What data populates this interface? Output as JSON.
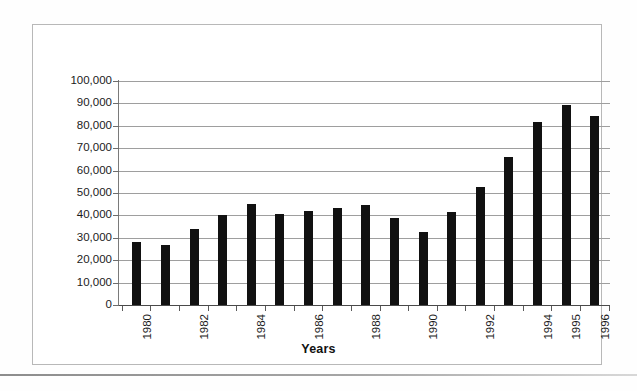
{
  "chart_data": {
    "type": "bar",
    "title": "",
    "xlabel": "Years",
    "ylabel": "",
    "categories": [
      "1980",
      "1981",
      "1982",
      "1983",
      "1984",
      "1985",
      "1986",
      "1987",
      "1988",
      "1989",
      "1990",
      "1991",
      "1992",
      "1993",
      "1994",
      "1995",
      "1996"
    ],
    "values": [
      28000,
      27000,
      34000,
      40000,
      45000,
      40500,
      42000,
      43500,
      44500,
      39000,
      32500,
      41500,
      52500,
      66000,
      81500,
      89500,
      84500
    ],
    "visible_tick_labels": [
      "1980",
      "",
      "1982",
      "",
      "1984",
      "",
      "1986",
      "",
      "1988",
      "",
      "1990",
      "",
      "1992",
      "",
      "1994",
      "1995",
      "1996"
    ],
    "ylim": [
      0,
      100000
    ],
    "ytick_labels": [
      "100,000",
      "90,000",
      "80,000",
      "70,000",
      "60,000",
      "50,000",
      "40,000",
      "30,000",
      "20,000",
      "10,000",
      "0"
    ],
    "ytick_values": [
      100000,
      90000,
      80000,
      70000,
      60000,
      50000,
      40000,
      30000,
      20000,
      10000,
      0
    ],
    "grid": true,
    "legend": "none",
    "bar_color": "#111111",
    "gridline_color": "#9e9e9e",
    "frame_color": "#b8b8b8"
  }
}
